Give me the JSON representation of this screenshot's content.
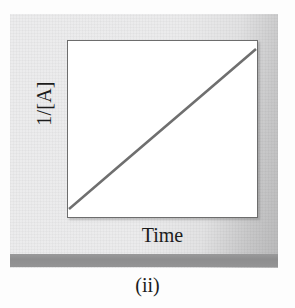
{
  "figure": {
    "caption": "(ii)",
    "panel_color": "#ebebec",
    "panel_band_color": "#8e8e8f",
    "plot_background": "#ffffff",
    "plot_border_color": "#6d6d6d",
    "line_color": "#6f6f6f"
  },
  "chart_data": {
    "type": "line",
    "title": "",
    "subtitle": "",
    "xlabel": "Time",
    "ylabel": "1/[A]",
    "annotations": [
      "(ii)"
    ],
    "legend": [],
    "legend_position": "none",
    "grid": false,
    "xticks": [],
    "yticks": [],
    "xticklabels": [],
    "yticklabels": [],
    "xlim": [
      0,
      1
    ],
    "ylim": [
      0,
      1
    ],
    "series": [
      {
        "name": "1/[A] vs Time",
        "color": "#6f6f6f",
        "linewidth": 2,
        "x": [
          0.0,
          0.25,
          0.5,
          0.75,
          1.0
        ],
        "y": [
          0.04,
          0.27,
          0.5,
          0.73,
          0.96
        ]
      }
    ]
  }
}
